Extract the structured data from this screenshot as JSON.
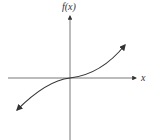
{
  "figure": {
    "y_axis_label": "f(x)",
    "x_axis_label": "x",
    "curve": "increasing cubic-like function through origin, arrows at both ends",
    "colors": {
      "stroke": "#333333",
      "background": "#ffffff"
    }
  }
}
